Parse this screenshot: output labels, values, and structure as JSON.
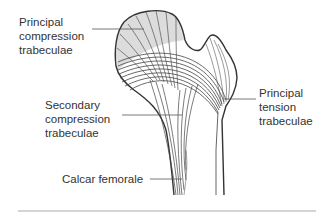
{
  "figure": {
    "labels": {
      "principal_compression": [
        "Principal",
        "compression",
        "trabeculae"
      ],
      "secondary_compression": [
        "Secondary",
        "compression",
        "trabeculae"
      ],
      "principal_tension": [
        "Principal",
        "tension",
        "trabeculae"
      ],
      "calcar": "Calcar femorale"
    },
    "colors": {
      "outline": "#333333",
      "trabeculae": "#555555",
      "fill": "#dcdcdc",
      "leader": "#555555",
      "rule": "#aaaaaa"
    }
  }
}
